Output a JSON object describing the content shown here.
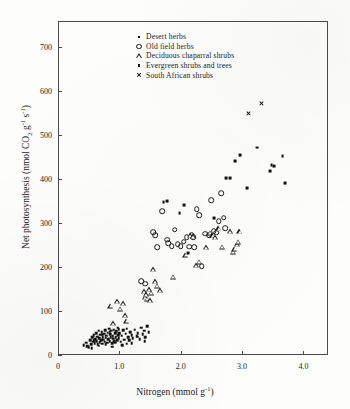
{
  "figure": {
    "background_color": "#fdfdfc",
    "frame_color": "#4a4a4a",
    "marker_color": "#111111"
  },
  "chart_data": {
    "type": "scatter",
    "title": "",
    "xlabel": "Nitrogen (mmol g",
    "xlabel_sup": "-1",
    "xlabel_tail": ")",
    "ylabel_a": "Net photosynthesis (nmol CO",
    "ylabel_sub": "2",
    "ylabel_b": " g",
    "ylabel_sup1": "-1",
    "ylabel_c": " s",
    "ylabel_sup2": "-1",
    "ylabel_tail": ")",
    "xlim": [
      0,
      4.4
    ],
    "ylim": [
      0,
      760
    ],
    "grid": false,
    "legend_position": "top-center",
    "xticks": [
      0,
      1.0,
      2.0,
      3.0,
      4.0
    ],
    "xtick_labels": [
      "0",
      "1.0",
      "2.0",
      "3.0",
      "4.0"
    ],
    "yticks": [
      0,
      100,
      200,
      300,
      400,
      500,
      600,
      700
    ],
    "ytick_labels": [
      "0",
      "100",
      "200",
      "300",
      "400",
      "500",
      "600",
      "700"
    ],
    "series": [
      {
        "name": "Desert herbs",
        "marker": "square-small-filled",
        "points": [
          [
            0.42,
            22
          ],
          [
            0.46,
            28
          ],
          [
            0.48,
            20
          ],
          [
            0.52,
            33
          ],
          [
            0.54,
            25
          ],
          [
            0.56,
            40
          ],
          [
            0.57,
            30
          ],
          [
            0.58,
            45
          ],
          [
            0.6,
            27
          ],
          [
            0.61,
            36
          ],
          [
            0.62,
            50
          ],
          [
            0.63,
            31
          ],
          [
            0.64,
            42
          ],
          [
            0.65,
            24
          ],
          [
            0.66,
            55
          ],
          [
            0.67,
            38
          ],
          [
            0.68,
            29
          ],
          [
            0.69,
            46
          ],
          [
            0.7,
            33
          ],
          [
            0.71,
            52
          ],
          [
            0.72,
            26
          ],
          [
            0.73,
            41
          ],
          [
            0.74,
            35
          ],
          [
            0.75,
            48
          ],
          [
            0.76,
            30
          ],
          [
            0.77,
            57
          ],
          [
            0.78,
            39
          ],
          [
            0.79,
            44
          ],
          [
            0.8,
            28
          ],
          [
            0.81,
            51
          ],
          [
            0.82,
            36
          ],
          [
            0.83,
            60
          ],
          [
            0.84,
            32
          ],
          [
            0.85,
            47
          ],
          [
            0.86,
            41
          ],
          [
            0.87,
            55
          ],
          [
            0.88,
            27
          ],
          [
            0.89,
            43
          ],
          [
            0.9,
            37
          ],
          [
            0.91,
            58
          ],
          [
            0.92,
            31
          ],
          [
            0.93,
            49
          ],
          [
            0.94,
            40
          ],
          [
            0.95,
            54
          ],
          [
            0.96,
            34
          ],
          [
            0.97,
            62
          ],
          [
            0.98,
            45
          ],
          [
            0.99,
            38
          ],
          [
            1.0,
            50
          ],
          [
            1.02,
            30
          ],
          [
            1.04,
            44
          ],
          [
            1.06,
            56
          ],
          [
            1.08,
            35
          ],
          [
            1.1,
            48
          ],
          [
            1.12,
            26
          ],
          [
            1.14,
            41
          ],
          [
            1.16,
            33
          ],
          [
            1.18,
            52
          ],
          [
            1.2,
            45
          ],
          [
            1.22,
            38
          ],
          [
            1.25,
            58
          ],
          [
            1.28,
            43
          ],
          [
            1.3,
            50
          ],
          [
            1.33,
            36
          ],
          [
            1.36,
            62
          ],
          [
            1.38,
            47
          ],
          [
            1.4,
            55
          ],
          [
            1.42,
            40
          ],
          [
            1.45,
            66
          ],
          [
            1.48,
            52
          ],
          [
            0.5,
            18
          ],
          [
            0.55,
            16
          ],
          [
            0.59,
            34
          ],
          [
            0.66,
            21
          ],
          [
            0.72,
            46
          ],
          [
            0.78,
            24
          ],
          [
            0.84,
            53
          ],
          [
            0.88,
            19
          ],
          [
            0.93,
            28
          ],
          [
            0.99,
            59
          ],
          [
            1.05,
            22
          ],
          [
            1.12,
            60
          ],
          [
            1.2,
            27
          ],
          [
            1.3,
            42
          ],
          [
            1.41,
            31
          ]
        ]
      },
      {
        "name": "Old field herbs",
        "marker": "circle-open",
        "points": [
          [
            1.36,
            168
          ],
          [
            1.42,
            162
          ],
          [
            1.55,
            280
          ],
          [
            1.58,
            272
          ],
          [
            1.62,
            245
          ],
          [
            1.7,
            327
          ],
          [
            1.78,
            262
          ],
          [
            1.8,
            255
          ],
          [
            1.85,
            248
          ],
          [
            1.9,
            285
          ],
          [
            1.95,
            252
          ],
          [
            2.0,
            248
          ],
          [
            2.05,
            258
          ],
          [
            2.1,
            268
          ],
          [
            2.14,
            246
          ],
          [
            2.18,
            272
          ],
          [
            2.2,
            268
          ],
          [
            2.22,
            245
          ],
          [
            2.26,
            332
          ],
          [
            2.3,
            318
          ],
          [
            2.34,
            202
          ],
          [
            2.4,
            276
          ],
          [
            2.46,
            272
          ],
          [
            2.5,
            352
          ],
          [
            2.54,
            282
          ],
          [
            2.58,
            278
          ],
          [
            2.62,
            305
          ],
          [
            2.66,
            368
          ],
          [
            2.7,
            312
          ],
          [
            2.72,
            288
          ]
        ]
      },
      {
        "name": "Deciduous chaparral shrubs",
        "marker": "triangle-open",
        "points": [
          [
            0.86,
            112
          ],
          [
            0.9,
            72
          ],
          [
            0.97,
            122
          ],
          [
            1.02,
            105
          ],
          [
            1.06,
            118
          ],
          [
            1.1,
            90
          ],
          [
            1.12,
            78
          ],
          [
            1.4,
            145
          ],
          [
            1.42,
            132
          ],
          [
            1.44,
            138
          ],
          [
            1.46,
            128
          ],
          [
            1.48,
            150
          ],
          [
            1.5,
            125
          ],
          [
            1.52,
            142
          ],
          [
            1.55,
            195
          ],
          [
            1.58,
            168
          ],
          [
            1.62,
            158
          ],
          [
            1.66,
            148
          ],
          [
            1.88,
            178
          ],
          [
            2.08,
            228
          ],
          [
            2.16,
            272
          ],
          [
            2.2,
            270
          ],
          [
            2.25,
            205
          ],
          [
            2.3,
            212
          ],
          [
            2.42,
            245
          ],
          [
            2.48,
            278
          ],
          [
            2.52,
            272
          ],
          [
            2.56,
            268
          ],
          [
            2.62,
            288
          ],
          [
            2.68,
            246
          ],
          [
            2.8,
            282
          ],
          [
            2.86,
            235
          ],
          [
            2.88,
            242
          ],
          [
            2.92,
            252
          ],
          [
            2.94,
            258
          ],
          [
            2.96,
            282
          ]
        ]
      },
      {
        "name": "Evergreen shrubs and trees",
        "marker": "dot-filled",
        "points": [
          [
            1.72,
            348
          ],
          [
            1.78,
            350
          ],
          [
            1.98,
            322
          ],
          [
            2.06,
            342
          ],
          [
            2.12,
            232
          ],
          [
            2.55,
            312
          ],
          [
            2.74,
            402
          ],
          [
            2.8,
            402
          ],
          [
            2.88,
            442
          ],
          [
            2.96,
            455
          ],
          [
            3.08,
            380
          ],
          [
            3.25,
            472
          ],
          [
            3.45,
            418
          ],
          [
            3.48,
            432
          ],
          [
            3.52,
            430
          ],
          [
            3.66,
            452
          ],
          [
            3.7,
            392
          ]
        ]
      },
      {
        "name": "South African shrubs",
        "marker": "cross",
        "points": [
          [
            3.1,
            550
          ],
          [
            3.32,
            572
          ]
        ]
      }
    ]
  },
  "legend": {
    "items": [
      {
        "label": "Desert herbs",
        "marker": "square-small-filled"
      },
      {
        "label": "Old field herbs",
        "marker": "circle-open"
      },
      {
        "label": "Deciduous chaparral shrubs",
        "marker": "triangle-open"
      },
      {
        "label": "Evergreen shrubs and trees",
        "marker": "dot-filled"
      },
      {
        "label": "South African shrubs",
        "marker": "cross"
      }
    ]
  }
}
